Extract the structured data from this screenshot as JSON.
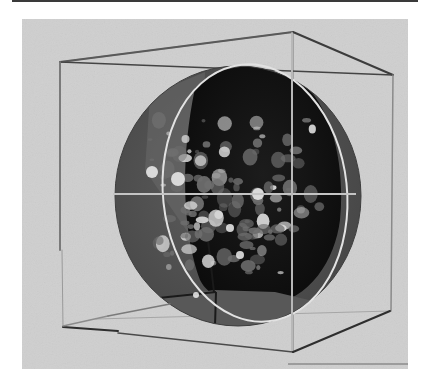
{
  "figure": {
    "colors": {
      "page_background": "#ffffff",
      "panel_background": "#cfcfcf",
      "sphere_shell": "#555555",
      "sphere_interior": "#141414",
      "cube_edge_dark": "#3c3c3c",
      "cube_edge_light": "#9a9a9a",
      "meridian": "#e2e2e2",
      "crosshair": "#bdbdbd",
      "structure_highlight": "#d8d8d8",
      "structure_mid": "#6e6e6e"
    },
    "elements": [
      "wireframe-cube",
      "sphere-shell",
      "sphere-interior",
      "internal-structures",
      "meridian-ellipse",
      "horizontal-crosshair",
      "vertical-crosshair"
    ]
  }
}
